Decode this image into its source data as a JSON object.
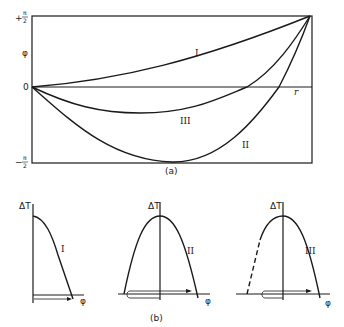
{
  "figure": {
    "panel_a": {
      "caption": "(a)",
      "y_axis_label": "φ",
      "y_ticks": {
        "top_sign": "+",
        "top_num": "π",
        "top_den": "2",
        "zero": "0",
        "bottom_sign": "−",
        "bottom_num": "π",
        "bottom_den": "2"
      },
      "x_axis_label": "r",
      "curves": [
        {
          "id": "I",
          "label": "I"
        },
        {
          "id": "II",
          "label": "II"
        },
        {
          "id": "III",
          "label": "III"
        }
      ]
    },
    "panel_b": {
      "caption": "(b)",
      "subplots": [
        {
          "id": "I",
          "label": "I",
          "y_axis_label": "ΔT",
          "x_axis_label": "φ"
        },
        {
          "id": "II",
          "label": "II",
          "y_axis_label": "ΔT",
          "x_axis_label": "φ"
        },
        {
          "id": "III",
          "label": "III",
          "y_axis_label": "ΔT",
          "x_axis_label": "φ"
        }
      ]
    }
  },
  "colors": {
    "ink": "#1a1a1a",
    "background": "#ffffff"
  }
}
